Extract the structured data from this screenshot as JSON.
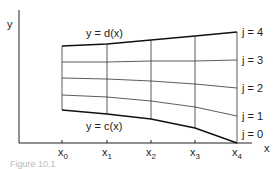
{
  "diagram": {
    "axis_y_label": "y",
    "axis_x_label": "x",
    "top_curve_label": "y = d(x)",
    "bottom_curve_label": "y = c(x)",
    "x_ticks": [
      {
        "base": "x",
        "sub": "0"
      },
      {
        "base": "x",
        "sub": "1"
      },
      {
        "base": "x",
        "sub": "2"
      },
      {
        "base": "x",
        "sub": "3"
      },
      {
        "base": "x",
        "sub": "4"
      }
    ],
    "j_labels": [
      "j = 4",
      "j = 3",
      "j = 2",
      "j = 1",
      "j = 0"
    ],
    "caption": "Figure 10.1"
  }
}
